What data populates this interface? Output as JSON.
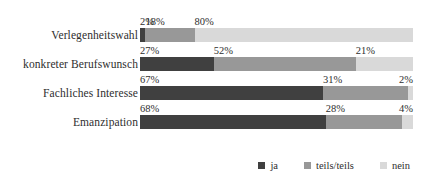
{
  "chart_data": {
    "type": "bar",
    "orientation": "horizontal",
    "stacked": true,
    "stack_total": 100,
    "unit": "%",
    "title": "",
    "subtitle": "",
    "xlabel": "",
    "ylabel": "",
    "xlim": [
      0,
      100
    ],
    "grid": false,
    "legend_position": "bottom-right",
    "categories": [
      "Verlegenheitswahl",
      "konkreter Berufswunsch",
      "Fachliches Interesse",
      "Emanzipation"
    ],
    "series": [
      {
        "name": "ja",
        "color": "#404040",
        "values": [
          2,
          27,
          67,
          68
        ]
      },
      {
        "name": "teils/teils",
        "color": "#989898",
        "values": [
          18,
          52,
          31,
          28
        ]
      },
      {
        "name": "nein",
        "color": "#d9d9d9",
        "values": [
          80,
          21,
          2,
          4
        ]
      }
    ],
    "data_labels": [
      [
        "2%",
        "18%",
        "80%"
      ],
      [
        "27%",
        "52%",
        "21%"
      ],
      [
        "67%",
        "31%",
        "2%"
      ],
      [
        "68%",
        "28%",
        "4%"
      ]
    ]
  },
  "legend": {
    "items": [
      {
        "label": "ja",
        "color": "#404040"
      },
      {
        "label": "teils/teils",
        "color": "#989898"
      },
      {
        "label": "nein",
        "color": "#d9d9d9"
      }
    ]
  },
  "rows": [
    {
      "category": "Verlegenheitswahl",
      "segments": [
        {
          "key": "ja",
          "value": 2,
          "label": "2%"
        },
        {
          "key": "teils",
          "value": 18,
          "label": "18%"
        },
        {
          "key": "nein",
          "value": 80,
          "label": "80%"
        }
      ]
    },
    {
      "category": "konkreter Berufswunsch",
      "segments": [
        {
          "key": "ja",
          "value": 27,
          "label": "27%"
        },
        {
          "key": "teils",
          "value": 52,
          "label": "52%"
        },
        {
          "key": "nein",
          "value": 21,
          "label": "21%"
        }
      ]
    },
    {
      "category": "Fachliches Interesse",
      "segments": [
        {
          "key": "ja",
          "value": 67,
          "label": "67%"
        },
        {
          "key": "teils",
          "value": 31,
          "label": "31%"
        },
        {
          "key": "nein",
          "value": 2,
          "label": "2%"
        }
      ]
    },
    {
      "category": "Emanzipation",
      "segments": [
        {
          "key": "ja",
          "value": 68,
          "label": "68%"
        },
        {
          "key": "teils",
          "value": 28,
          "label": "28%"
        },
        {
          "key": "nein",
          "value": 4,
          "label": "4%"
        }
      ]
    }
  ]
}
